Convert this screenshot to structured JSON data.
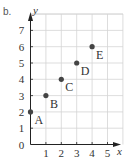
{
  "part_label": "b.",
  "colors": {
    "grid": "#d4d4d4",
    "axis": "#222222",
    "point": "#444444",
    "text": "#333333"
  },
  "chart_data": {
    "type": "scatter",
    "title": "",
    "xlabel": "x",
    "ylabel": "y",
    "xlim": [
      0,
      6
    ],
    "ylim": [
      0,
      8
    ],
    "grid": true,
    "x_ticks": [
      "1",
      "2",
      "3",
      "4",
      "5"
    ],
    "y_ticks": [
      "0",
      "1",
      "2",
      "3",
      "4",
      "5",
      "6",
      "7"
    ],
    "points": [
      {
        "label": "A",
        "x": 0,
        "y": 2
      },
      {
        "label": "B",
        "x": 1,
        "y": 3
      },
      {
        "label": "C",
        "x": 2,
        "y": 4
      },
      {
        "label": "D",
        "x": 3,
        "y": 5
      },
      {
        "label": "E",
        "x": 4,
        "y": 6
      }
    ]
  }
}
